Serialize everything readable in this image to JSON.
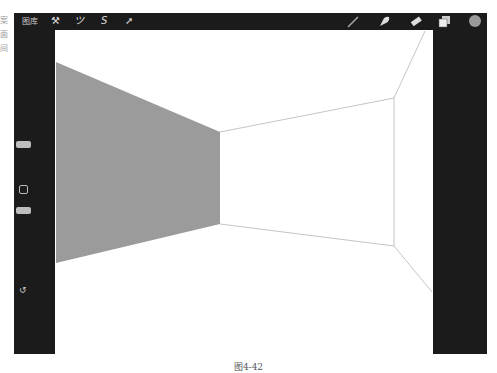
{
  "side_text": [
    "案",
    "面",
    "间"
  ],
  "toolbar": {
    "gallery_label": "图库",
    "left_tools": [
      {
        "name": "wrench-icon",
        "glyph": "⚒"
      },
      {
        "name": "magic-wand-icon",
        "glyph": "⁄"
      },
      {
        "name": "selection-icon",
        "glyph": "S"
      },
      {
        "name": "transform-arrow-icon",
        "glyph": "➚"
      }
    ],
    "right_tools": [
      {
        "name": "brush-icon"
      },
      {
        "name": "smudge-icon"
      },
      {
        "name": "eraser-icon"
      },
      {
        "name": "layers-icon"
      },
      {
        "name": "color-picker-icon",
        "color": "#9a9a9a"
      }
    ]
  },
  "sidebar": {
    "undo_glyph": "↺"
  },
  "canvas": {
    "fill_color": "#9b9b9b",
    "line_color": "#b5b5b5"
  },
  "caption": "图4-42"
}
